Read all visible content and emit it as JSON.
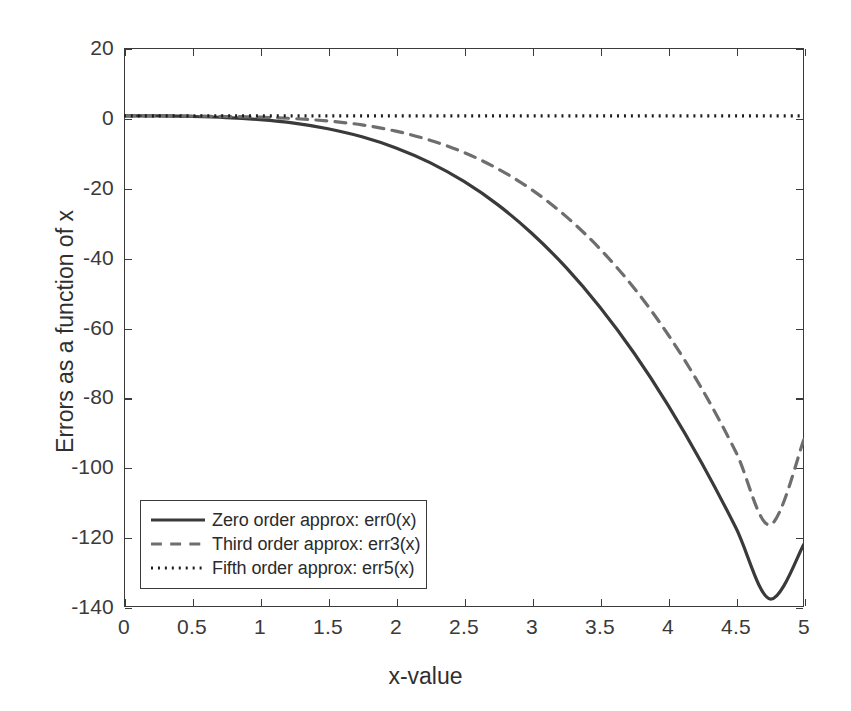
{
  "chart_data": {
    "type": "line",
    "title": "",
    "xlabel": "x-value",
    "ylabel": "Errors as a function of x",
    "xlim": [
      0,
      5
    ],
    "ylim": [
      -140,
      20
    ],
    "grid": false,
    "legend_position": "lower left",
    "xticks": [
      0,
      0.5,
      1,
      1.5,
      2,
      2.5,
      3,
      3.5,
      4,
      4.5,
      5
    ],
    "xtick_labels": [
      "0",
      "0.5",
      "1",
      "1.5",
      "2",
      "2.5",
      "3",
      "3.5",
      "4",
      "4.5",
      "5"
    ],
    "yticks": [
      20,
      0,
      -20,
      -40,
      -60,
      -80,
      -100,
      -120,
      -140
    ],
    "ytick_labels": [
      "20",
      "0",
      "-20",
      "-40",
      "-60",
      "-80",
      "-100",
      "-120",
      "-140"
    ],
    "x": [
      0,
      0.25,
      0.5,
      0.75,
      1,
      1.25,
      1.5,
      1.75,
      2,
      2.25,
      2.5,
      2.75,
      3,
      3.25,
      3.5,
      3.75,
      4,
      4.25,
      4.5,
      4.75,
      5
    ],
    "series": [
      {
        "name": "Zero order approx: err0(x)",
        "label": "Zero order approx: err0(x)",
        "style": "solid",
        "color": "#3a3a3a",
        "width": 3.2,
        "values": [
          0.6,
          0.55,
          0.4,
          0.1,
          -0.5,
          -1.5,
          -3.1,
          -5.4,
          -8.6,
          -12.8,
          -18.2,
          -24.9,
          -33.1,
          -42.8,
          -54.2,
          -67.3,
          -82.2,
          -98.9,
          -117.4,
          -137.7,
          -122.0
        ]
      },
      {
        "name": "Third order approx: err3(x)",
        "label": "Third order approx: err3(x)",
        "style": "dashed",
        "color": "#6e6e6e",
        "width": 3.2,
        "values": [
          0.6,
          0.58,
          0.52,
          0.4,
          0.2,
          -0.2,
          -0.9,
          -2.0,
          -3.8,
          -6.4,
          -9.9,
          -14.6,
          -20.6,
          -28.2,
          -37.5,
          -48.7,
          -62.0,
          -77.6,
          -95.7,
          -116.5,
          -92.0
        ]
      },
      {
        "name": "Fifth order approx: err5(x)",
        "label": "Fifth order approx: err5(x)",
        "style": "dotted",
        "color": "#1c1c1c",
        "width": 3.2,
        "values": [
          0.6,
          0.6,
          0.6,
          0.6,
          0.6,
          0.6,
          0.6,
          0.6,
          0.6,
          0.6,
          0.6,
          0.6,
          0.6,
          0.6,
          0.6,
          0.6,
          0.6,
          0.6,
          0.6,
          0.6,
          0.6
        ]
      }
    ]
  },
  "legend": {
    "items": [
      {
        "label": "Zero order approx: err0(x)",
        "style": "solid"
      },
      {
        "label": "Third order approx: err3(x)",
        "style": "dashed"
      },
      {
        "label": "Fifth order approx: err5(x)",
        "style": "dotted"
      }
    ]
  }
}
